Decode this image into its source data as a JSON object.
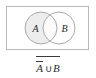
{
  "figure": {
    "type": "venn-diagram",
    "universe": {
      "label": "",
      "shape": "rectangle",
      "stroke_color": "#b8b8b8",
      "fill_color": "#ffffff",
      "x": 6,
      "y": 6,
      "width": 83,
      "height": 44
    },
    "sets": [
      {
        "name": "A",
        "label": "A",
        "cx": 41,
        "cy": 28,
        "r": 16,
        "shaded": true,
        "fill_color": "#ededed",
        "stroke_color": "#aaaaaa",
        "label_x": 36,
        "label_y": 29
      },
      {
        "name": "B",
        "label": "B",
        "cx": 59,
        "cy": 28,
        "r": 16,
        "shaded": false,
        "fill_color": "#ffffff",
        "stroke_color": "#aaaaaa",
        "label_x": 64,
        "label_y": 29
      }
    ],
    "intersection": {
      "name": "A-intersect-B",
      "shaded": false,
      "fill_color": "#ffffff"
    }
  },
  "caption": {
    "expression_text": "A ∪ B",
    "term_a": "A",
    "operator": "∪",
    "term_b": "B",
    "term_a_overline": true,
    "whole_overline": true,
    "plain_text": "complement of (complement of A union B)"
  },
  "colors": {
    "background": "#ffffff",
    "stroke": "#aaaaaa",
    "rect_stroke": "#b8b8b8",
    "shade": "#ededed",
    "text": "#2b2b2b",
    "bar": "#3a3a3a"
  }
}
